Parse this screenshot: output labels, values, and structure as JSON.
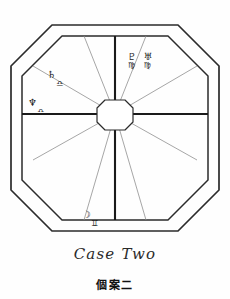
{
  "page": {
    "background_color": "#fefefe",
    "ink_color": "#1b1b1b"
  },
  "chart": {
    "title": "Case Two",
    "type": "octagonal-house-chart",
    "outer_octagon_color": "#2b2b2b",
    "inner_octagon_color": "#2b2b2b",
    "spoke_color": "#8a8a8a",
    "axis_color": "#1a1a1a",
    "center_hub_shape": "octagon",
    "house_count": 12,
    "placements": [
      {
        "id": "pluto-uranus-in-virgo",
        "planets": [
          "♇",
          "♅"
        ],
        "planet_names": [
          "Pluto",
          "Uranus"
        ],
        "signs": [
          "♍",
          "♍"
        ],
        "sign_names": [
          "Virgo",
          "Virgo"
        ],
        "position": "upper-right-house"
      },
      {
        "id": "saturn-in-libra",
        "planets": [
          "♄"
        ],
        "planet_names": [
          "Saturn"
        ],
        "signs": [
          "♎"
        ],
        "sign_names": [
          "Libra"
        ],
        "position": "upper-left-house"
      },
      {
        "id": "neptune-in-libra",
        "planets": [
          "♆"
        ],
        "planet_names": [
          "Neptune"
        ],
        "signs": [
          "♎"
        ],
        "sign_names": [
          "Libra"
        ],
        "position": "left-upper-house"
      },
      {
        "id": "moon-node-in-aries",
        "planets": [
          "☽"
        ],
        "planet_names": [
          "Moon"
        ],
        "signs": [
          "♊"
        ],
        "sign_names": [
          "Gemini"
        ],
        "position": "lower-left-house"
      }
    ]
  },
  "captions": {
    "english": "Case Two",
    "chinese": "個案二"
  }
}
